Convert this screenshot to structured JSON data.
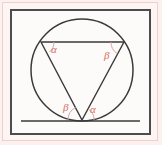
{
  "figure": {
    "kind": "geometry-diagram",
    "colors": {
      "page_background": "#fbf2f0",
      "inner_background": "#fdfbfa",
      "outer_border": "#f4cfca",
      "frame": "#4c4c4c",
      "stroke": "#3a3a3a",
      "label": "#d98a7c"
    },
    "frame": {
      "x": 10,
      "y": 9,
      "width": 141,
      "height": 126,
      "border_width": 2
    },
    "circle": {
      "cx": 82,
      "cy": 70,
      "r": 51,
      "stroke_width": 1.4
    },
    "tangent_line": {
      "x1": 21,
      "y1": 121,
      "x2": 140,
      "y2": 121,
      "stroke_width": 1.4
    },
    "triangle": {
      "apex": {
        "x": 82,
        "y": 120
      },
      "chord_left": {
        "x": 41,
        "y": 42
      },
      "chord_right": {
        "x": 124,
        "y": 42
      },
      "stroke_width": 1.3
    },
    "arcs": [
      {
        "name": "arc-alpha-top-left",
        "cx": 41,
        "cy": 42,
        "r": 13
      },
      {
        "name": "arc-beta-top-right",
        "cx": 124,
        "cy": 42,
        "r": 13
      },
      {
        "name": "arc-beta-bottom-left",
        "cx": 82,
        "cy": 120,
        "r": 14
      },
      {
        "name": "arc-alpha-bottom-right",
        "cx": 82,
        "cy": 120,
        "r": 12
      }
    ],
    "labels": [
      {
        "name": "angle-alpha-top-left",
        "text": "α",
        "x": 51,
        "y": 44
      },
      {
        "name": "angle-beta-top-right",
        "text": "β",
        "x": 104,
        "y": 50
      },
      {
        "name": "angle-beta-bottom-left",
        "text": "β",
        "x": 63,
        "y": 102
      },
      {
        "name": "angle-alpha-bottom-right",
        "text": "α",
        "x": 90,
        "y": 104
      }
    ]
  }
}
